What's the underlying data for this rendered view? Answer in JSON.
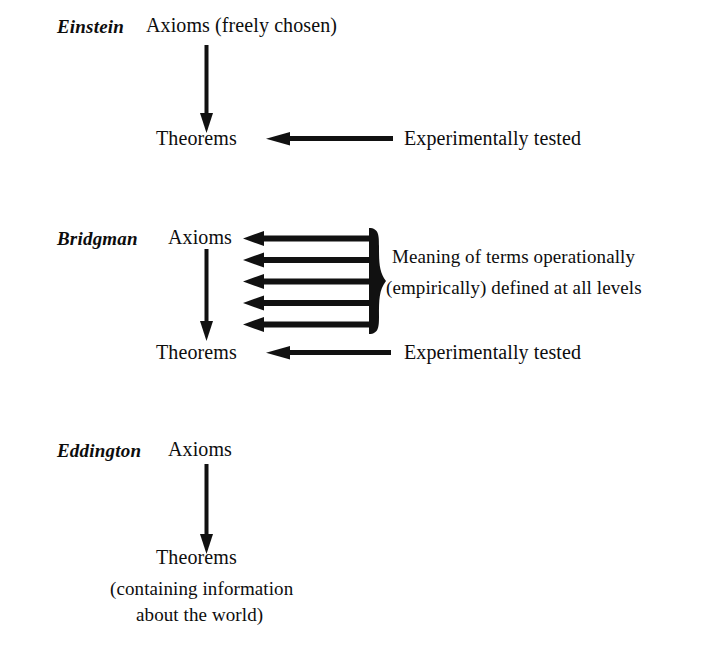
{
  "figure": {
    "background_color": "#ffffff",
    "ink_color": "#111111",
    "sections": [
      {
        "thinker": "Einstein",
        "top_term": "Axioms (freely chosen)",
        "bottom_term": "Theorems",
        "side_note": "Experimentally tested"
      },
      {
        "thinker": "Bridgman",
        "top_term": "Axioms",
        "bottom_term": "Theorems",
        "side_note": "Experimentally tested",
        "brace_note_line1": "Meaning of terms operationally",
        "brace_note_line2": "(empirically) defined at all levels",
        "brace_arrow_count": 5
      },
      {
        "thinker": "Eddington",
        "top_term": "Axioms",
        "bottom_term": "Theorems",
        "caption_line1": "(containing information",
        "caption_line2": "about the world)"
      }
    ]
  }
}
